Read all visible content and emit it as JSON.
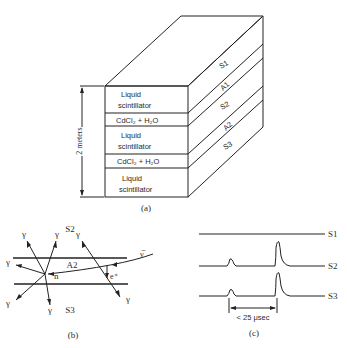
{
  "figure_a": {
    "caption": "(a)",
    "height_label": "2 meters",
    "front_layers": [
      {
        "lines": [
          "Liquid",
          "scintillator"
        ]
      },
      {
        "lines": [
          "CdCl₂ + H₂O"
        ]
      },
      {
        "lines": [
          "Liquid",
          "scintillator"
        ]
      },
      {
        "lines": [
          "CdCl₂ + H₂O"
        ]
      },
      {
        "lines": [
          "Liquid",
          "scintillator"
        ]
      }
    ],
    "side_labels": [
      "S1",
      "A1",
      "S2",
      "A2",
      "S3"
    ]
  },
  "figure_b": {
    "caption": "(b)",
    "region_top": "S2",
    "region_middle": "A2",
    "region_bottom": "S3",
    "gamma": "γ",
    "neutron": "n",
    "antineutrino": "ν̅",
    "positron": "e⁺"
  },
  "figure_c": {
    "caption": "(c)",
    "traces": [
      "S1",
      "S2",
      "S3"
    ],
    "interval_label": "< 25 μsec"
  }
}
